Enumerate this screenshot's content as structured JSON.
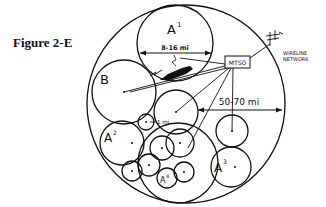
{
  "figure": {
    "label": "Figure 2-E"
  },
  "diagram": {
    "cells": {
      "a1": "A",
      "a1_sup": "1",
      "b": "B",
      "a2": "A",
      "a2_sup": "2",
      "a3": "A",
      "a3_sup": "3",
      "a4": "A",
      "a4_sup": "4"
    },
    "dimensions": {
      "small_cell": "8-16 mi",
      "large_area": "50-70 mi",
      "micro_cell": "1 mi"
    },
    "mtso_label": "MTSO",
    "wireline_label_line1": "WIRELINE",
    "wireline_label_line2": "NETWORK",
    "stroke_color": "#111111",
    "background": "#ffffff"
  }
}
